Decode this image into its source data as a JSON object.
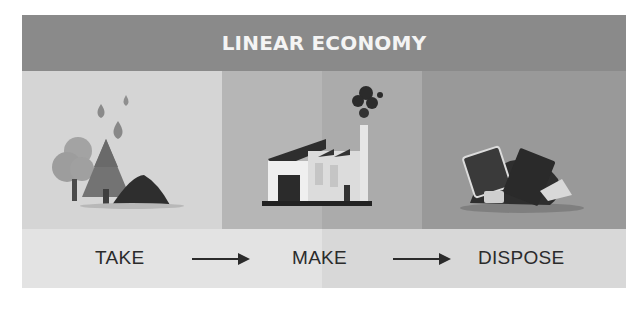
{
  "title": "LINEAR ECONOMY",
  "panels": [
    {
      "name": "take",
      "illustration": "trees-water-soil-icon"
    },
    {
      "name": "make",
      "illustration": "factory-smoke-icon"
    },
    {
      "name": "dispose",
      "illustration": "waste-pile-icon"
    }
  ],
  "steps": [
    "TAKE",
    "MAKE",
    "DISPOSE"
  ],
  "arrows": [
    "arrow-right-icon",
    "arrow-right-icon"
  ],
  "colors": {
    "header": "#8a8a8a",
    "title_text": "#f4f4f4",
    "panel_take": "#d5d5d5",
    "panel_make": "#b0b0b0",
    "panel_dispose": "#999999",
    "band": "#e0e0e0",
    "step_text": "#2b2b2b"
  }
}
